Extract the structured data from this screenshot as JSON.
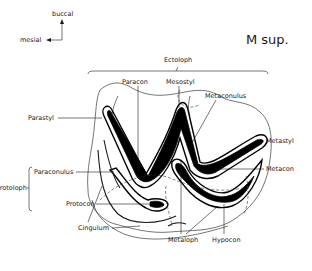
{
  "title": "M sup.",
  "orientation": {
    "buccal_label": "buccal",
    "mesial_label": "mesial"
  },
  "labels": {
    "ectoloph": "Ectoloph",
    "paracon": "Paracon",
    "mesostyl": "Mesostyl",
    "metaconulus": "Metaconulus",
    "parastyl": "Parastyl",
    "metastyl": "Metastyl",
    "metacon": "Metacon",
    "paraconulus": "Paraconulus",
    "protoloph": "Protoloph",
    "protocon": "Protocon",
    "cingulum": "Cingulum",
    "metaloph": "Metaloph",
    "hypocon": "Hypocon"
  }
}
